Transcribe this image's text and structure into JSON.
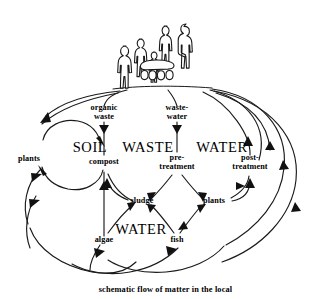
{
  "diagram": {
    "caption": "schematic flow of matter in the local",
    "background_color": "#ffffff",
    "ink_color": "#1a1a1a",
    "zones": [
      {
        "id": "soil",
        "label": "SOIL"
      },
      {
        "id": "waste",
        "label": "WASTE"
      },
      {
        "id": "water_right",
        "label": "WATER"
      },
      {
        "id": "water_bottom",
        "label": "WATER"
      }
    ],
    "nodes": [
      {
        "id": "people",
        "label": "",
        "type": "figure-group"
      },
      {
        "id": "organic_waste",
        "label_line1": "organic",
        "label_line2": "waste"
      },
      {
        "id": "waste_water",
        "label_line1": "waste-",
        "label_line2": "water"
      },
      {
        "id": "plants_left",
        "label": "plants"
      },
      {
        "id": "compost",
        "label": "compost"
      },
      {
        "id": "pre_treatment",
        "label_line1": "pre-",
        "label_line2": "treatment"
      },
      {
        "id": "post_treatment",
        "label_line1": "post-",
        "label_line2": "treatment"
      },
      {
        "id": "sludge",
        "label": "sludge"
      },
      {
        "id": "plants_right",
        "label": "plants"
      },
      {
        "id": "algae",
        "label": "algae"
      },
      {
        "id": "fish",
        "label": "fish"
      }
    ],
    "flows": [
      {
        "from": "people",
        "to": "organic_waste"
      },
      {
        "from": "people",
        "to": "waste_water"
      },
      {
        "from": "people",
        "to": "plants_left"
      },
      {
        "from": "organic_waste",
        "to": "compost"
      },
      {
        "from": "waste_water",
        "to": "pre_treatment"
      },
      {
        "from": "plants_left",
        "to": "compost"
      },
      {
        "from": "compost",
        "to": "plants_left"
      },
      {
        "from": "pre_treatment",
        "to": "sludge"
      },
      {
        "from": "pre_treatment",
        "to": "plants_right"
      },
      {
        "from": "sludge",
        "to": "compost"
      },
      {
        "from": "compost",
        "to": "sludge"
      },
      {
        "from": "algae",
        "to": "compost"
      },
      {
        "from": "algae",
        "to": "sludge"
      },
      {
        "from": "fish",
        "to": "sludge"
      },
      {
        "from": "fish",
        "to": "plants_right"
      },
      {
        "from": "plants_right",
        "to": "fish"
      },
      {
        "from": "plants_right",
        "to": "post_treatment"
      },
      {
        "from": "post_treatment",
        "to": "people"
      },
      {
        "from": "plants_left",
        "to": "people"
      },
      {
        "from": "fish",
        "to": "people"
      },
      {
        "from": "algae",
        "to": "people"
      }
    ],
    "icons": {
      "people_group": "people-group-icon",
      "cart": "handcart-icon"
    }
  }
}
